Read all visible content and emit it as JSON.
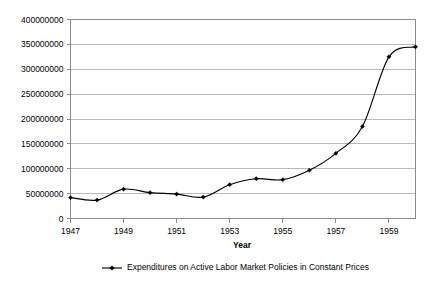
{
  "chart_data": {
    "type": "line",
    "title": "",
    "xlabel": "Year",
    "ylabel": "",
    "xlim": [
      1947,
      1960
    ],
    "ylim": [
      0,
      400000000
    ],
    "grid": true,
    "legend_position": "bottom",
    "x": [
      1947,
      1948,
      1949,
      1950,
      1951,
      1952,
      1953,
      1954,
      1955,
      1956,
      1957,
      1958,
      1959,
      1960
    ],
    "series": [
      {
        "name": "Expenditures on Active Labor Market Policies in Constant Prices",
        "marker": "diamond",
        "color": "#000000",
        "values": [
          42000000,
          37000000,
          59000000,
          52000000,
          49000000,
          43000000,
          68000000,
          80000000,
          78000000,
          97000000,
          131000000,
          185000000,
          325000000,
          345000000
        ]
      }
    ],
    "y_ticks": [
      0,
      50000000,
      100000000,
      150000000,
      200000000,
      250000000,
      300000000,
      350000000,
      400000000
    ],
    "y_tick_labels": [
      "0",
      "50000000",
      "100000000",
      "150000000",
      "200000000",
      "250000000",
      "300000000",
      "350000000",
      "400000000"
    ],
    "x_ticks": [
      1947,
      1949,
      1951,
      1953,
      1955,
      1957,
      1959
    ],
    "x_tick_labels": [
      "1947",
      "1949",
      "1951",
      "1953",
      "1955",
      "1957",
      "1959"
    ],
    "legend": [
      {
        "label": "Expenditures on Active Labor Market Policies in Constant Prices"
      }
    ]
  }
}
